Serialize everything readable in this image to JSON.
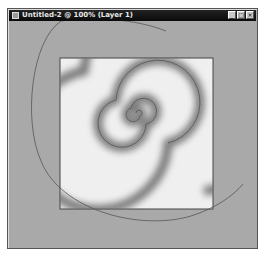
{
  "window": {
    "title": "Untitled-2 @ 100% (Layer 1)",
    "controls": {
      "minimize": "_",
      "maximize": "□",
      "close": "×"
    }
  },
  "canvas": {
    "background": "#efefef",
    "artwork": "spiral-gradient"
  },
  "colors": {
    "titlebar": "#111111",
    "workspace": "#a9a9a9",
    "canvas": "#efefef",
    "spiral_stroke": "#555555"
  }
}
